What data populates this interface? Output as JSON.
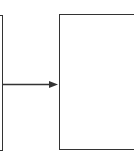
{
  "diagram": {
    "nodes": [
      {
        "id": "left-box",
        "label": ""
      },
      {
        "id": "right-box",
        "label": ""
      }
    ],
    "edges": [
      {
        "from": "left-box",
        "to": "right-box",
        "type": "arrow"
      }
    ],
    "colors": {
      "stroke": "#333333",
      "background": "#ffffff"
    }
  }
}
